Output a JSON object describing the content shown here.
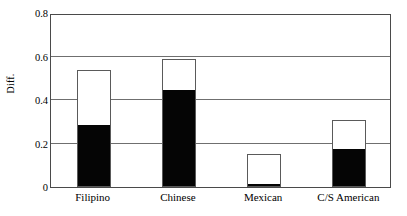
{
  "chart_data": {
    "type": "bar",
    "title": "",
    "xlabel": "",
    "ylabel": "Diff.",
    "ylim": [
      0,
      0.8
    ],
    "yticks": [
      "0",
      "0.2",
      "0.4",
      "0.6",
      "0.8"
    ],
    "ytick_values": [
      0,
      0.2,
      0.4,
      0.6,
      0.8
    ],
    "grid": true,
    "legend": "none",
    "stacked": true,
    "categories": [
      "Filipino",
      "Chinese",
      "Mexican",
      "C/S American"
    ],
    "series": [
      {
        "name": "black-segment",
        "color": "#050505",
        "values": [
          0.28,
          0.44,
          0.01,
          0.17
        ]
      },
      {
        "name": "white-segment",
        "color": "#ffffff",
        "values": [
          0.26,
          0.15,
          0.14,
          0.14
        ]
      }
    ],
    "totals": [
      0.54,
      0.59,
      0.15,
      0.31
    ]
  },
  "axes": {
    "y_title": "Diff.",
    "y_ticks": [
      {
        "label": "0.8",
        "value": 0.8
      },
      {
        "label": "0.6",
        "value": 0.6
      },
      {
        "label": "0.4",
        "value": 0.4
      },
      {
        "label": "0.2",
        "value": 0.2
      },
      {
        "label": "0",
        "value": 0
      }
    ],
    "x_ticks": [
      {
        "label": "Filipino"
      },
      {
        "label": "Chinese"
      },
      {
        "label": "Mexican"
      },
      {
        "label": "C/S American"
      }
    ]
  },
  "colors": {
    "bar_fill": "#050505",
    "bar_empty": "#ffffff",
    "bar_outline": "#5a5a5a",
    "grid": "#6f6f6f",
    "axis": "#4a4a4a",
    "background": "#ffffff",
    "text": "#000000"
  }
}
